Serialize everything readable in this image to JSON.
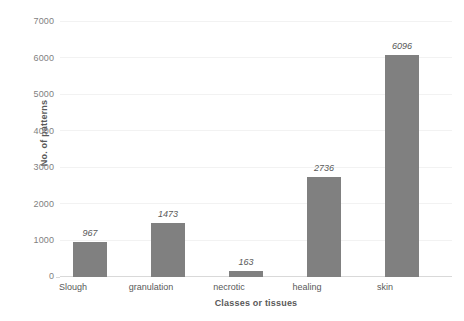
{
  "chart_data": {
    "type": "bar",
    "title": "",
    "xlabel": "Classes or tissues",
    "ylabel": "No. of patterns",
    "categories": [
      "Slough",
      "granulation",
      "necrotic",
      "healing",
      "skin"
    ],
    "values": [
      967,
      1473,
      163,
      2736,
      6096
    ],
    "value_labels": [
      "967",
      "1473",
      "163",
      "2736",
      "6096"
    ],
    "ylim": [
      0,
      7000
    ],
    "ytick_labels": [
      "0",
      "1000",
      "2000",
      "3000",
      "4000",
      "5000",
      "6000",
      "7000"
    ],
    "ytick_values": [
      0,
      1000,
      2000,
      3000,
      4000,
      5000,
      6000,
      7000
    ],
    "grid": "horizontal",
    "legend": "none",
    "series": [
      {
        "name": "No. of patterns",
        "color": "#808080",
        "values": [
          967,
          1473,
          163,
          2736,
          6096
        ]
      }
    ]
  },
  "style": {
    "bar_color": "#808080",
    "grid_color": "#f2f2f2",
    "axis_color": "#d9d9d9",
    "text_color": "#595959",
    "tick_text_color": "#7f7f7f",
    "background": "#ffffff"
  }
}
